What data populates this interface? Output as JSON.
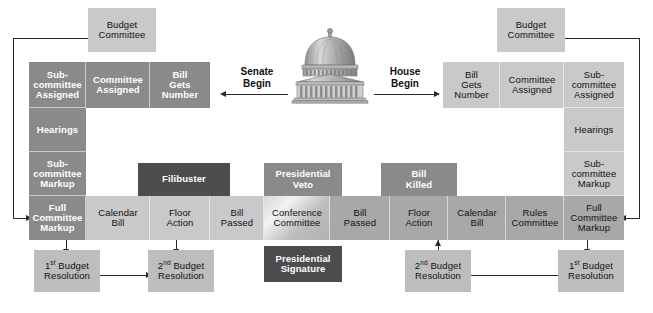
{
  "diagram": {
    "center_icon": "capitol-building-icon",
    "colors": {
      "box_light": "#c9c9c9",
      "box_mid": "#a8a8a8",
      "box_dark": "#8a8a8a",
      "box_darkest": "#4d4d4d",
      "line": "#2a2a2a",
      "background": "#ffffff"
    }
  },
  "senate": {
    "begin_label": "Senate\nBegin",
    "budget_committee": "Budget\nCommittee",
    "intake_row": [
      {
        "label": "Sub-\ncommittee\nAssigned"
      },
      {
        "label": "Committee\nAssigned"
      },
      {
        "label": "Bill\nGets\nNumber"
      }
    ],
    "committee_column": [
      {
        "label": "Sub-\ncommittee\nAssigned"
      },
      {
        "label": "Hearings"
      },
      {
        "label": "Sub-\ncommittee\nMarkup"
      },
      {
        "label": "Full\nCommittee\nMarkup"
      }
    ],
    "floor_row": [
      {
        "label": "Calendar\nBill"
      },
      {
        "label": "Floor\nAction"
      },
      {
        "label": "Bill\nPassed"
      }
    ],
    "filibuster": "Filibuster",
    "first_budget_resolution": "1st Budget\nResolution",
    "second_budget_resolution": "2nd Budget\nResolution"
  },
  "house": {
    "begin_label": "House\nBegin",
    "budget_committee": "Budget\nCommittee",
    "intake_row": [
      {
        "label": "Bill\nGets\nNumber"
      },
      {
        "label": "Committee\nAssigned"
      },
      {
        "label": "Sub-\ncommittee\nAssigned"
      }
    ],
    "committee_column": [
      {
        "label": "Sub-\ncommittee\nAssigned"
      },
      {
        "label": "Hearings"
      },
      {
        "label": "Sub-\ncommittee\nMarkup"
      },
      {
        "label": "Full\nCommittee\nMarkup"
      }
    ],
    "floor_row": [
      {
        "label": "Bill\nPassed"
      },
      {
        "label": "Floor\nAction"
      },
      {
        "label": "Calendar\nBill"
      },
      {
        "label": "Rules\nCommittee"
      }
    ],
    "bill_killed": "Bill\nKilled",
    "first_budget_resolution": "1st Budget\nResolution",
    "second_budget_resolution": "2nd Budget\nResolution"
  },
  "center": {
    "conference_committee": "Conference\nCommittee",
    "presidential_veto": "Presidential\nVeto",
    "presidential_signature": "Presidential\nSignature"
  },
  "ordinals": {
    "first_prefix": "1",
    "first_sup": "st",
    "second_prefix": "2",
    "second_sup": "nd",
    "budget_resolution_suffix": " Budget\nResolution"
  }
}
